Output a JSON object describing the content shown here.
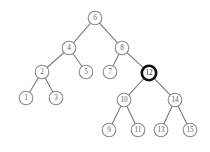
{
  "figure": {
    "name": "binary-search-tree-diagram",
    "background_color": "#ffffff",
    "width": 210,
    "height": 152
  },
  "style": {
    "node_fill": "#ffffff",
    "node_stroke": "#8a8a8a",
    "node_stroke_width": 1.1,
    "node_radius": 6.8,
    "highlight_stroke": "#101010",
    "highlight_stroke_width": 2.6,
    "edge_stroke": "#7a7a7a",
    "edge_stroke_width": 1.1,
    "label_color": "#5e5e5e",
    "highlight_label_color": "#2b2b2b",
    "label_font_size": 7.2
  },
  "chart_data": {
    "type": "diagram",
    "title": "",
    "subtitle": "",
    "nodes": [
      {
        "id": "n6",
        "label": "6",
        "x": 95,
        "y": 18,
        "r": 6.8,
        "level": 0,
        "highlighted": false
      },
      {
        "id": "n4",
        "label": "4",
        "x": 69,
        "y": 48,
        "r": 6.8,
        "level": 1,
        "highlighted": false
      },
      {
        "id": "n8",
        "label": "8",
        "x": 122,
        "y": 48,
        "r": 6.8,
        "level": 1,
        "highlighted": false
      },
      {
        "id": "n2",
        "label": "2",
        "x": 42,
        "y": 72,
        "r": 6.8,
        "level": 2,
        "highlighted": false
      },
      {
        "id": "n5",
        "label": "5",
        "x": 86,
        "y": 72,
        "r": 6.8,
        "level": 2,
        "highlighted": false
      },
      {
        "id": "n7",
        "label": "7",
        "x": 110,
        "y": 72,
        "r": 6.8,
        "level": 2,
        "highlighted": false
      },
      {
        "id": "n12",
        "label": "12",
        "x": 149,
        "y": 73,
        "r": 7.2,
        "level": 2,
        "highlighted": true
      },
      {
        "id": "n1",
        "label": "1",
        "x": 26,
        "y": 98,
        "r": 6.8,
        "level": 3,
        "highlighted": false
      },
      {
        "id": "n3",
        "label": "3",
        "x": 56,
        "y": 98,
        "r": 6.8,
        "level": 3,
        "highlighted": false
      },
      {
        "id": "n10",
        "label": "10",
        "x": 124,
        "y": 100,
        "r": 6.8,
        "level": 3,
        "highlighted": false
      },
      {
        "id": "n14",
        "label": "14",
        "x": 175,
        "y": 100,
        "r": 6.8,
        "level": 3,
        "highlighted": false
      },
      {
        "id": "n9",
        "label": "9",
        "x": 109,
        "y": 130,
        "r": 6.8,
        "level": 4,
        "highlighted": false
      },
      {
        "id": "n11",
        "label": "11",
        "x": 138,
        "y": 130,
        "r": 6.8,
        "level": 4,
        "highlighted": false
      },
      {
        "id": "n13",
        "label": "13",
        "x": 161,
        "y": 130,
        "r": 6.8,
        "level": 4,
        "highlighted": false
      },
      {
        "id": "n15",
        "label": "15",
        "x": 190,
        "y": 130,
        "r": 6.8,
        "level": 4,
        "highlighted": false
      }
    ],
    "edges": [
      {
        "from": "n6",
        "to": "n4"
      },
      {
        "from": "n6",
        "to": "n8"
      },
      {
        "from": "n4",
        "to": "n2"
      },
      {
        "from": "n4",
        "to": "n5"
      },
      {
        "from": "n8",
        "to": "n7"
      },
      {
        "from": "n8",
        "to": "n12"
      },
      {
        "from": "n2",
        "to": "n1"
      },
      {
        "from": "n2",
        "to": "n3"
      },
      {
        "from": "n12",
        "to": "n10"
      },
      {
        "from": "n12",
        "to": "n14"
      },
      {
        "from": "n10",
        "to": "n9"
      },
      {
        "from": "n10",
        "to": "n11"
      },
      {
        "from": "n14",
        "to": "n13"
      },
      {
        "from": "n14",
        "to": "n15"
      }
    ],
    "highlighted_node": "12",
    "labels": [
      "6",
      "4",
      "8",
      "2",
      "5",
      "7",
      "12",
      "1",
      "3",
      "10",
      "14",
      "9",
      "11",
      "13",
      "15"
    ]
  }
}
